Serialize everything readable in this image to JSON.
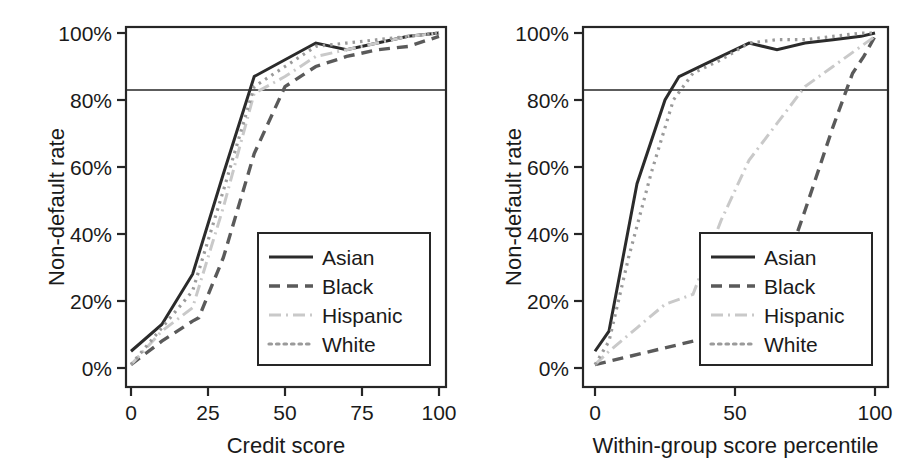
{
  "figure": {
    "background": "#ffffff",
    "axis_color": "#262626",
    "panels": [
      "left",
      "right"
    ]
  },
  "series_styles": {
    "Asian": {
      "color": "#2b2b2b",
      "dash": "none",
      "width": 3.0,
      "dasharray": ""
    },
    "Black": {
      "color": "#5a5a5a",
      "dash": "dashed",
      "width": 3.4,
      "dasharray": "11,7"
    },
    "Hispanic": {
      "color": "#c9c9c9",
      "dash": "dashdot",
      "width": 3.0,
      "dasharray": "12,5,2,5"
    },
    "White": {
      "color": "#9a9a9a",
      "dash": "dotted",
      "width": 3.2,
      "dasharray": "2.5,5"
    }
  },
  "chart_data": [
    {
      "panel": "left",
      "type": "line",
      "title": "",
      "xlabel": "Credit score",
      "ylabel": "Non-default rate",
      "xlim": [
        0,
        100
      ],
      "ylim": [
        0,
        100
      ],
      "xticks": [
        0,
        25,
        50,
        75,
        100
      ],
      "xticklabels": [
        "0",
        "25",
        "50",
        "75",
        "100"
      ],
      "yticks": [
        0,
        20,
        40,
        60,
        80,
        100
      ],
      "yticklabels": [
        "0%",
        "20%",
        "40%",
        "60%",
        "80%",
        "100%"
      ],
      "grid": false,
      "legend_position": "lower right",
      "annotations": [
        {
          "kind": "hline",
          "y": 83,
          "label": "83% non-default reference line"
        }
      ],
      "series": [
        {
          "name": "Asian",
          "x": [
            0,
            10,
            20,
            30,
            40,
            50,
            60,
            70,
            80,
            90,
            100
          ],
          "y": [
            5,
            13,
            28,
            58,
            87,
            92,
            97,
            95,
            97,
            99,
            100
          ]
        },
        {
          "name": "Black",
          "x": [
            0,
            10,
            20,
            22,
            30,
            40,
            50,
            60,
            70,
            80,
            90,
            100
          ],
          "y": [
            1,
            8,
            14,
            15,
            33,
            64,
            84,
            90,
            93,
            95,
            96,
            99
          ]
        },
        {
          "name": "Hispanic",
          "x": [
            0,
            10,
            20,
            30,
            40,
            50,
            60,
            70,
            80,
            90,
            100
          ],
          "y": [
            1,
            11,
            18,
            48,
            82,
            87,
            93,
            95,
            97,
            99,
            100
          ]
        },
        {
          "name": "White",
          "x": [
            0,
            10,
            20,
            30,
            40,
            50,
            60,
            70,
            80,
            90,
            100
          ],
          "y": [
            1,
            12,
            23,
            53,
            84,
            90,
            96,
            97,
            98,
            99,
            100
          ]
        }
      ]
    },
    {
      "panel": "right",
      "type": "line",
      "title": "",
      "xlabel": "Within-group score percentile",
      "ylabel": "Non-default rate",
      "xlim": [
        0,
        100
      ],
      "ylim": [
        0,
        100
      ],
      "xticks": [
        0,
        50,
        100
      ],
      "xticklabels": [
        "0",
        "50",
        "100"
      ],
      "yticks": [
        0,
        20,
        40,
        60,
        80,
        100
      ],
      "yticklabels": [
        "0%",
        "20%",
        "40%",
        "60%",
        "80%",
        "100%"
      ],
      "grid": false,
      "legend_position": "lower right",
      "annotations": [
        {
          "kind": "hline",
          "y": 83,
          "label": "83% non-default reference line"
        }
      ],
      "series": [
        {
          "name": "Asian",
          "x": [
            0,
            5,
            15,
            25,
            30,
            40,
            55,
            65,
            75,
            85,
            95,
            100
          ],
          "y": [
            5,
            11,
            55,
            80,
            87,
            91,
            97,
            95,
            97,
            98,
            99,
            100
          ]
        },
        {
          "name": "Black",
          "x": [
            0,
            10,
            25,
            40,
            55,
            65,
            75,
            85,
            92,
            96,
            100
          ],
          "y": [
            1,
            3,
            6,
            9,
            11,
            23,
            47,
            72,
            88,
            93,
            99
          ]
        },
        {
          "name": "Hispanic",
          "x": [
            0,
            5,
            15,
            25,
            35,
            45,
            55,
            65,
            75,
            85,
            95,
            100
          ],
          "y": [
            1,
            5,
            12,
            19,
            22,
            44,
            62,
            73,
            84,
            90,
            96,
            99
          ]
        },
        {
          "name": "White",
          "x": [
            0,
            5,
            12,
            20,
            28,
            35,
            45,
            55,
            65,
            75,
            85,
            95,
            100
          ],
          "y": [
            1,
            8,
            33,
            58,
            80,
            88,
            92,
            97,
            98,
            98,
            99,
            100,
            100
          ]
        }
      ]
    }
  ],
  "legend": {
    "entries": [
      {
        "label": "Asian"
      },
      {
        "label": "Black"
      },
      {
        "label": "Hispanic"
      },
      {
        "label": "White"
      }
    ]
  }
}
